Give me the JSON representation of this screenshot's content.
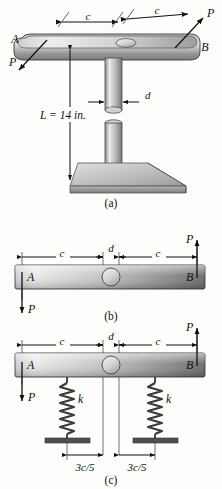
{
  "figure": {
    "title_parts": [
      "(a)",
      "(b)",
      "(c)"
    ],
    "background_color": "#fdfdfc",
    "bar_light_color": "#d8d8d8",
    "bar_dark_color": "#6e6e6e",
    "outline_color": "#2a2a2a"
  },
  "part_a": {
    "caption": "(a)",
    "label_A": "A",
    "label_B": "B",
    "force_left": "P",
    "force_right": "P",
    "dim_c_left": "c",
    "dim_c_right": "c",
    "dim_d": "d",
    "length_label": "L = 14 in.",
    "length_value": 14,
    "length_units": "in."
  },
  "part_b": {
    "caption": "(b)",
    "label_A": "A",
    "label_B": "B",
    "force_left": "P",
    "force_right": "P",
    "dim_c_left": "c",
    "dim_c_right": "c",
    "dim_d": "d"
  },
  "part_c": {
    "caption": "(c)",
    "label_A": "A",
    "label_B": "B",
    "force_left": "P",
    "force_right": "P",
    "dim_c_left": "c",
    "dim_c_right": "c",
    "dim_d": "d",
    "spring_left_label": "k",
    "spring_right_label": "k",
    "spring_left_position": "3c/5",
    "spring_right_position": "3c/5"
  }
}
